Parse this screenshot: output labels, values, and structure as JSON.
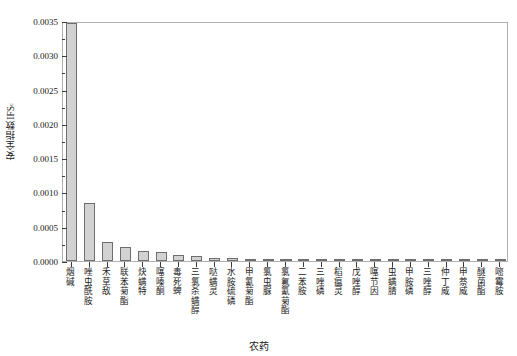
{
  "chart_data": {
    "type": "bar",
    "title": "",
    "xlabel": "农药",
    "ylabel": "安全指数IFS",
    "ylabel_subscript": "c",
    "ylim": [
      0.0,
      0.0035
    ],
    "ytick_values": [
      "0.0000",
      "0.0005",
      "0.0010",
      "0.0015",
      "0.0020",
      "0.0025",
      "0.0030",
      "0.0035"
    ],
    "grid": false,
    "legend": "none",
    "bar_color": "#d2d2d2",
    "bar_edge_color": "#6e6e6e",
    "axis_color": "#b0b0b0",
    "categories": [
      "烟碱",
      "唑虫酰胺",
      "禾草敌",
      "联苯菊酯",
      "炔螨特",
      "噻嗪酮",
      "毒死蜱",
      "三氯杀螨醇",
      "哒螨灵",
      "水胺硫磷",
      "甲氰菊酯",
      "氯虫脲",
      "氯氟氰菊酯",
      "二苯胺",
      "三唑磷",
      "稻瘟灵",
      "戊唑醇",
      "噻节因",
      "虫螨腈",
      "甲胺磷",
      "三唑醇",
      "仲丁威",
      "甲萘威",
      "醚菌酯",
      "嘧霉胺"
    ],
    "values": [
      0.00347,
      0.00085,
      0.00028,
      0.00021,
      0.00014,
      0.000125,
      9e-05,
      8e-05,
      5e-05,
      4e-05,
      3.5e-05,
      3e-05,
      2.5e-05,
      2e-05,
      1.8e-05,
      1.5e-05,
      1.2e-05,
      1e-05,
      8e-06,
      6e-06,
      5e-06,
      4e-06,
      3e-06,
      2e-06,
      1e-06
    ]
  }
}
